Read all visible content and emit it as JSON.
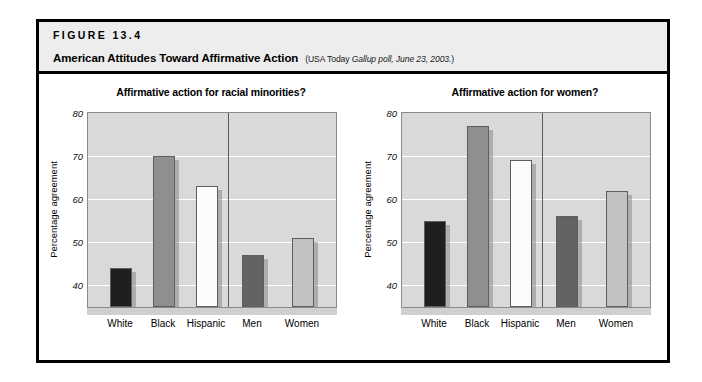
{
  "figure": {
    "number_label": "FIGURE 13.4",
    "title": "American Attitudes Toward Affirmative Action",
    "source_prefix": "(USA Today ",
    "source_italic": "Gallup poll, June 23, 2003.",
    "source_suffix": ")"
  },
  "colors": {
    "frame": "#000000",
    "header_band": "#ededed",
    "plot_background": "#d9d9d9",
    "gridline": "#ffffff",
    "bar_white_group": "#1f1f1f",
    "bar_black_group": "#8f8f8f",
    "bar_hispanic_group": "#fcfcfc",
    "bar_men_group": "#636363",
    "bar_women_group": "#c2c2c2",
    "divider": "#5a5a5a"
  },
  "chart_data": [
    {
      "type": "bar",
      "title": "Affirmative action for racial minorities?",
      "xlabel": "",
      "ylabel": "Percentage agreement",
      "ylim": [
        35,
        80
      ],
      "yticks": [
        40,
        50,
        60,
        70,
        80
      ],
      "grid": true,
      "legend": "none",
      "categories": [
        "White",
        "Black",
        "Hispanic",
        "Men",
        "Women"
      ],
      "values": [
        44,
        70,
        63,
        47,
        51
      ],
      "group_divider_after": "Hispanic",
      "groups": [
        {
          "name": "race",
          "categories": [
            "White",
            "Black",
            "Hispanic"
          ]
        },
        {
          "name": "gender",
          "categories": [
            "Men",
            "Women"
          ]
        }
      ]
    },
    {
      "type": "bar",
      "title": "Affirmative action for women?",
      "xlabel": "",
      "ylabel": "Percentage agreement",
      "ylim": [
        35,
        80
      ],
      "yticks": [
        40,
        50,
        60,
        70,
        80
      ],
      "grid": true,
      "legend": "none",
      "categories": [
        "White",
        "Black",
        "Hispanic",
        "Men",
        "Women"
      ],
      "values": [
        55,
        77,
        69,
        56,
        62
      ],
      "group_divider_after": "Hispanic",
      "groups": [
        {
          "name": "race",
          "categories": [
            "White",
            "Black",
            "Hispanic"
          ]
        },
        {
          "name": "gender",
          "categories": [
            "Men",
            "Women"
          ]
        }
      ]
    }
  ]
}
